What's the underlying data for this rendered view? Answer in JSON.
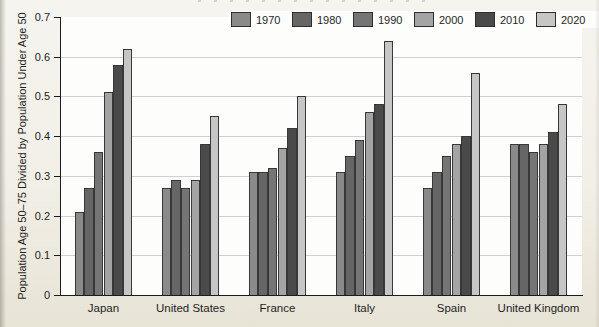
{
  "figure": {
    "background": "#f2efe7",
    "plot_background": "#fdfdfc",
    "gridline_color": "#ccd1d5",
    "axis_color": "#1c1c1c"
  },
  "y_axis": {
    "title": "Population Age 50–75 Divided by Population Under Age 50",
    "values": [
      0.7,
      0.6,
      0.5,
      0.4,
      0.3,
      0.2,
      0.1,
      0
    ],
    "labels": [
      "0.7",
      "0.6",
      "0.5",
      "0.4",
      "0.3",
      "0.2",
      "0.1",
      "0"
    ]
  },
  "chart_data": {
    "type": "bar",
    "title": "",
    "categories": [
      "Japan",
      "United States",
      "France",
      "Italy",
      "Spain",
      "United Kingdom"
    ],
    "series": [
      {
        "name": "1970",
        "color": "#8a8a8a",
        "values": [
          0.21,
          0.27,
          0.31,
          0.31,
          0.27,
          0.38
        ]
      },
      {
        "name": "1980",
        "color": "#666666",
        "values": [
          0.27,
          0.29,
          0.31,
          0.35,
          0.31,
          0.38
        ]
      },
      {
        "name": "1990",
        "color": "#757575",
        "values": [
          0.36,
          0.27,
          0.32,
          0.39,
          0.35,
          0.36
        ]
      },
      {
        "name": "2000",
        "color": "#a4a4a4",
        "values": [
          0.51,
          0.29,
          0.37,
          0.46,
          0.38,
          0.38
        ]
      },
      {
        "name": "2010",
        "color": "#4a4a4a",
        "values": [
          0.58,
          0.38,
          0.42,
          0.48,
          0.4,
          0.41
        ]
      },
      {
        "name": "2020",
        "color": "#c6c6c6",
        "values": [
          0.62,
          0.45,
          0.5,
          0.64,
          0.56,
          0.48
        ]
      }
    ],
    "xlabel": "",
    "ylabel": "Population Age 50–75 Divided by Population Under Age 50",
    "ylim": [
      0,
      0.7
    ],
    "yticks": [
      0,
      0.1,
      0.2,
      0.3,
      0.4,
      0.5,
      0.6,
      0.7
    ],
    "gridlines": [
      0.1,
      0.2,
      0.3,
      0.4,
      0.5,
      0.6
    ],
    "grid": true,
    "legend_position": "top"
  }
}
